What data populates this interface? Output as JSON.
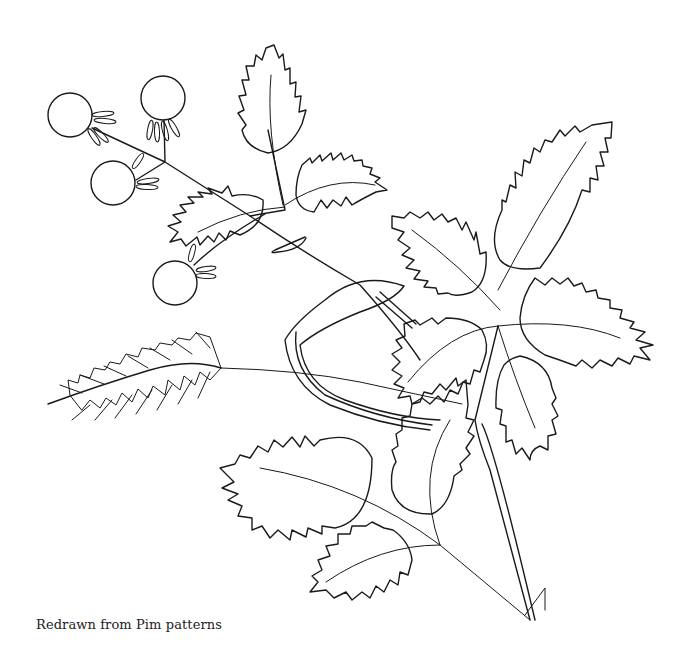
{
  "illustration": {
    "subject": "Rose branch with hips and wheat ear (embroidery line pattern)",
    "stroke_color": "#1a1a1a",
    "background": "#ffffff"
  },
  "caption": {
    "text": "Redrawn from Pim patterns"
  }
}
